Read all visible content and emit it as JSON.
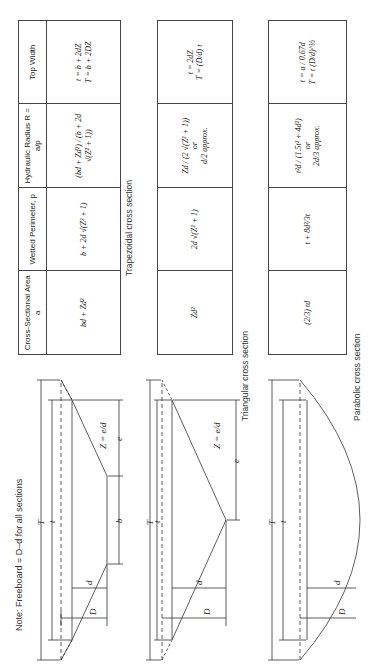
{
  "note": "Note: Freeboard = D–d for all sections",
  "headers": {
    "area": "Cross-Sectional Area a",
    "perimeter": "Wetted Perimeter, p",
    "radius": "Hydraulic Radius R = a/p",
    "top_width": "Top Width"
  },
  "sections": [
    {
      "caption": "Trapezoidal cross section",
      "area": "bd + Zd²",
      "perimeter": "b + 2d √(Z² + 1)",
      "radius": "(bd + Zd²) / (b + 2d √(Z² + 1))",
      "top_width_1": "t = b + 2dZ",
      "top_width_2": "T = b + 2DZ",
      "labels": {
        "T": "T",
        "t": "t",
        "d": "d",
        "D": "D",
        "b": "b",
        "e": "e",
        "Z": "Z = e/d"
      }
    },
    {
      "caption": "Triangular cross section",
      "area": "Zd²",
      "perimeter": "2d √(Z² + 1)",
      "radius_1": "Zd / (2 √(Z² + 1))",
      "radius_or": "or",
      "radius_2": "d/2 approx.",
      "top_width_1": "t = 2dZ",
      "top_width_2": "T = (D/d) t",
      "labels": {
        "T": "T",
        "t": "t",
        "d": "d",
        "D": "D",
        "e": "e",
        "Z": "Z = e/d"
      }
    },
    {
      "caption": "Parabolic cross section",
      "area": "(2/3) td",
      "perimeter": "t + 8d²/3t",
      "radius_1": "t²d / (1.5t² + 4d²)",
      "radius_or": "or",
      "radius_2": "2d/3 approx.",
      "top_width_1": "t = a / 0.67d",
      "top_width_2": "T = t (D/d)^½",
      "labels": {
        "T": "T",
        "t": "t",
        "d": "d",
        "D": "D"
      }
    }
  ]
}
